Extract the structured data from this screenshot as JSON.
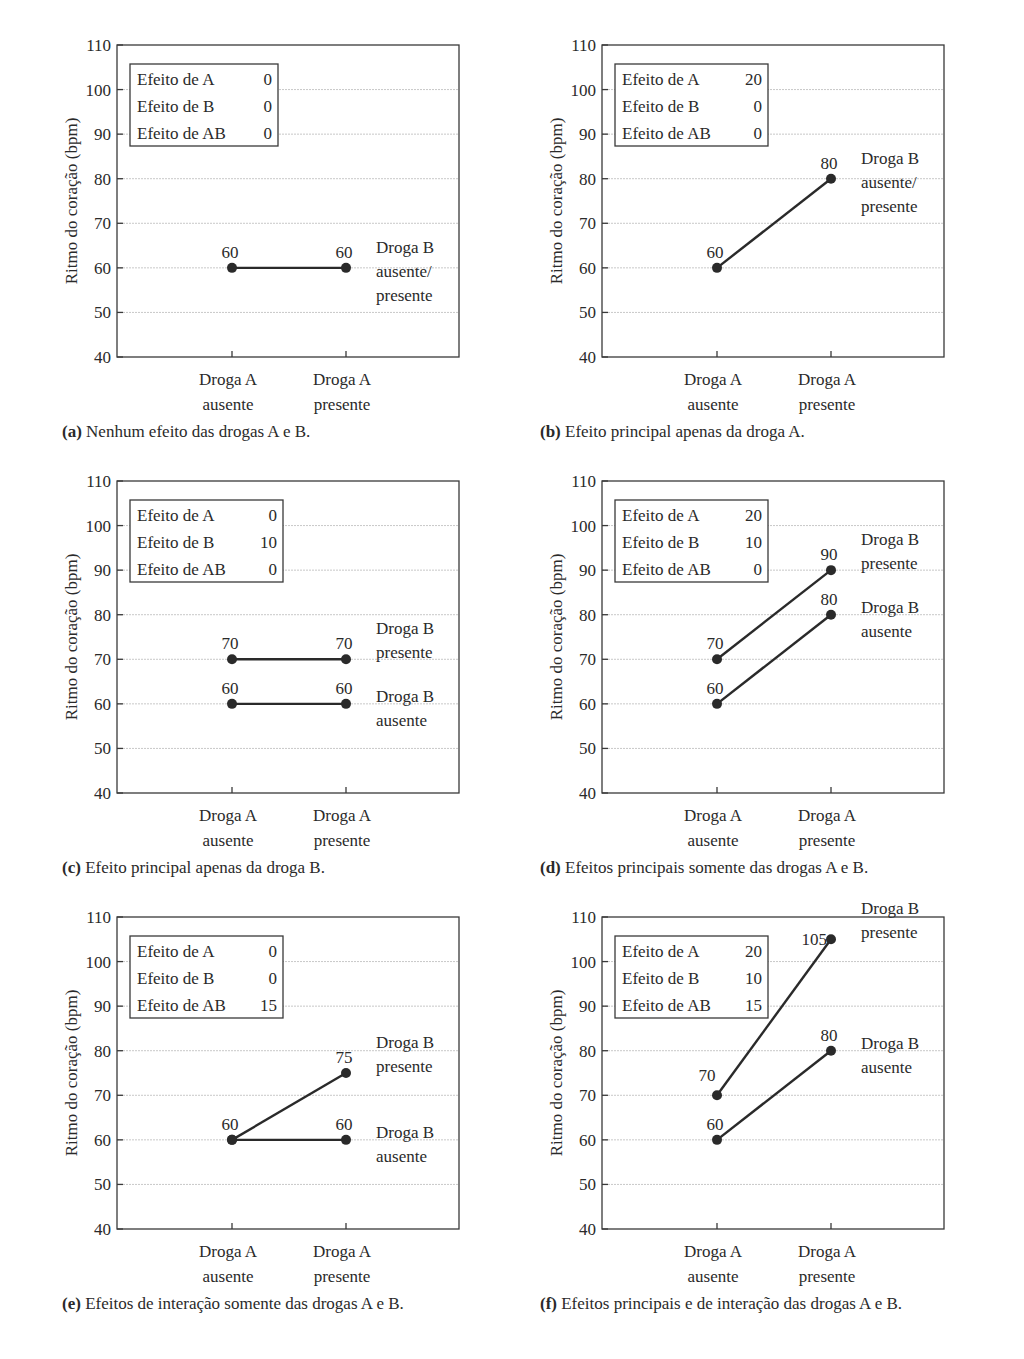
{
  "figure": {
    "y_axis_label": "Ritmo do coração (bpm)",
    "y_ticks": [
      40,
      50,
      60,
      70,
      80,
      90,
      100,
      110
    ],
    "x_categories": [
      [
        "Droga A",
        "ausente"
      ],
      [
        "Droga A",
        "presente"
      ]
    ],
    "effects_labels": [
      "Efeito de A",
      "Efeito de B",
      "Efeito de AB"
    ]
  },
  "panels": [
    {
      "id": "a",
      "caption_letter": "(a)",
      "caption_text": " Nenhum efeito das drogas A e B."
    },
    {
      "id": "b",
      "caption_letter": "(b)",
      "caption_text": " Efeito principal apenas da droga A."
    },
    {
      "id": "c",
      "caption_letter": "(c)",
      "caption_text": " Efeito principal apenas da droga B."
    },
    {
      "id": "d",
      "caption_letter": "(d)",
      "caption_text": " Efeitos principais somente das drogas A e B."
    },
    {
      "id": "e",
      "caption_letter": "(e)",
      "caption_text": " Efeitos de interação somente das drogas A e B."
    },
    {
      "id": "f",
      "caption_letter": "(f)",
      "caption_text": " Efeitos principais e de interação das drogas A e B."
    }
  ],
  "chart_data": [
    {
      "type": "line",
      "panel": "a",
      "title": "(a) Nenhum efeito das drogas A e B.",
      "xlabel": "",
      "ylabel": "Ritmo do coração (bpm)",
      "ylim": [
        40,
        110
      ],
      "grid": true,
      "categories": [
        "Droga A ausente",
        "Droga A presente"
      ],
      "effects": {
        "Efeito de A": 0,
        "Efeito de B": 0,
        "Efeito de AB": 0
      },
      "series": [
        {
          "name": "Droga B ausente/ presente",
          "label_lines": [
            "Droga B",
            "ausente/",
            "presente"
          ],
          "values": [
            60,
            60
          ]
        }
      ]
    },
    {
      "type": "line",
      "panel": "b",
      "title": "(b) Efeito principal apenas da droga A.",
      "xlabel": "",
      "ylabel": "Ritmo do coração (bpm)",
      "ylim": [
        40,
        110
      ],
      "grid": true,
      "categories": [
        "Droga A ausente",
        "Droga A presente"
      ],
      "effects": {
        "Efeito de A": 20,
        "Efeito de B": 0,
        "Efeito de AB": 0
      },
      "series": [
        {
          "name": "Droga B ausente/ presente",
          "label_lines": [
            "Droga B",
            "ausente/",
            "presente"
          ],
          "values": [
            60,
            80
          ]
        }
      ]
    },
    {
      "type": "line",
      "panel": "c",
      "title": "(c) Efeito principal apenas da droga B.",
      "xlabel": "",
      "ylabel": "Ritmo do coração (bpm)",
      "ylim": [
        40,
        110
      ],
      "grid": true,
      "categories": [
        "Droga A ausente",
        "Droga A presente"
      ],
      "effects": {
        "Efeito de A": 0,
        "Efeito de B": 10,
        "Efeito de AB": 0
      },
      "series": [
        {
          "name": "Droga B presente",
          "label_lines": [
            "Droga B",
            "presente"
          ],
          "values": [
            70,
            70
          ]
        },
        {
          "name": "Droga B ausente",
          "label_lines": [
            "Droga B",
            "ausente"
          ],
          "values": [
            60,
            60
          ]
        }
      ]
    },
    {
      "type": "line",
      "panel": "d",
      "title": "(d) Efeitos principais somente das drogas A e B.",
      "xlabel": "",
      "ylabel": "Ritmo do coração (bpm)",
      "ylim": [
        40,
        110
      ],
      "grid": true,
      "categories": [
        "Droga A ausente",
        "Droga A presente"
      ],
      "effects": {
        "Efeito de A": 20,
        "Efeito de B": 10,
        "Efeito de AB": 0
      },
      "series": [
        {
          "name": "Droga B presente",
          "label_lines": [
            "Droga B",
            "presente"
          ],
          "values": [
            70,
            90
          ]
        },
        {
          "name": "Droga B ausente",
          "label_lines": [
            "Droga B",
            "ausente"
          ],
          "values": [
            60,
            80
          ]
        }
      ]
    },
    {
      "type": "line",
      "panel": "e",
      "title": "(e) Efeitos de interação somente das drogas A e B.",
      "xlabel": "",
      "ylabel": "Ritmo do coração (bpm)",
      "ylim": [
        40,
        110
      ],
      "grid": true,
      "categories": [
        "Droga A ausente",
        "Droga A presente"
      ],
      "effects": {
        "Efeito de A": 0,
        "Efeito de B": 0,
        "Efeito de AB": 15
      },
      "series": [
        {
          "name": "Droga B presente",
          "label_lines": [
            "Droga B",
            "presente"
          ],
          "values": [
            60,
            75
          ]
        },
        {
          "name": "Droga B ausente",
          "label_lines": [
            "Droga B",
            "ausente"
          ],
          "values": [
            60,
            60
          ]
        }
      ]
    },
    {
      "type": "line",
      "panel": "f",
      "title": "(f) Efeitos principais e de interação das drogas A e B.",
      "xlabel": "",
      "ylabel": "Ritmo do coração (bpm)",
      "ylim": [
        40,
        110
      ],
      "grid": true,
      "categories": [
        "Droga A ausente",
        "Droga A presente"
      ],
      "effects": {
        "Efeito de A": 20,
        "Efeito de B": 10,
        "Efeito de AB": 15
      },
      "series": [
        {
          "name": "Droga B presente",
          "label_lines": [
            "Droga B",
            "presente"
          ],
          "values": [
            70,
            105
          ]
        },
        {
          "name": "Droga B ausente",
          "label_lines": [
            "Droga B",
            "ausente"
          ],
          "values": [
            60,
            80
          ]
        }
      ]
    }
  ],
  "colors": {
    "ink": "#2a2a2a",
    "grid": "#c8c8c8",
    "frame": "#3a3a3a",
    "background": "#ffffff"
  }
}
